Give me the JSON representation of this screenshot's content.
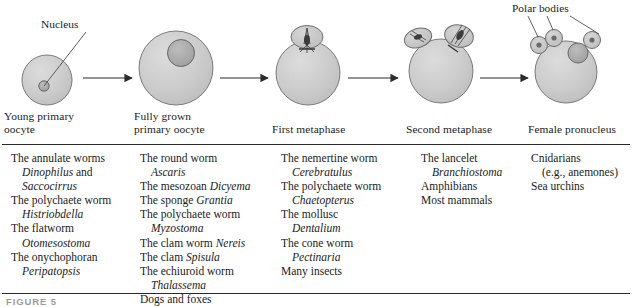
{
  "figure": {
    "caption_partial": "FIGURE 5"
  },
  "colors": {
    "cell_fill": "#c9c9c9",
    "cell_stroke": "#6e6e6e",
    "nucleus_fill": "#a8a8a8",
    "nucleus_stroke": "#5a5a5a",
    "spindle": "#4a4a4a",
    "rule": "#2b2b2b",
    "text": "#1b1b1b"
  },
  "callouts": [
    {
      "id": "nucleus",
      "label": "Nucleus"
    },
    {
      "id": "polar-bodies",
      "label": "Polar bodies"
    }
  ],
  "stages": [
    {
      "id": "young-primary-oocyte",
      "label": "Young primary\noocyte"
    },
    {
      "id": "fully-grown-primary-oocyte",
      "label": "Fully grown\nprimary oocyte"
    },
    {
      "id": "first-metaphase",
      "label": "First metaphase"
    },
    {
      "id": "second-metaphase",
      "label": "Second metaphase"
    },
    {
      "id": "female-pronucleus",
      "label": "Female pronucleus"
    }
  ],
  "arrows": [
    {
      "id": "arrow-1"
    },
    {
      "id": "arrow-2"
    },
    {
      "id": "arrow-3"
    },
    {
      "id": "arrow-4"
    }
  ],
  "species_columns": [
    {
      "id": "column-young-primary-oocyte",
      "lines": [
        {
          "text": "The annulate worms",
          "indent": false,
          "italic": false
        },
        {
          "text": "Dinophilus and",
          "indent": true,
          "italic": "partial",
          "italic_text": "Dinophilus",
          "rest": " and"
        },
        {
          "text": "Saccocirrus",
          "indent": true,
          "italic": true
        },
        {
          "text": "The polychaete worm",
          "indent": false,
          "italic": false
        },
        {
          "text": "Histriobdella",
          "indent": true,
          "italic": true
        },
        {
          "text": "The flatworm",
          "indent": false,
          "italic": false
        },
        {
          "text": "Otomesostoma",
          "indent": true,
          "italic": true
        },
        {
          "text": "The onychophoran",
          "indent": false,
          "italic": false
        },
        {
          "text": "Peripatopsis",
          "indent": true,
          "italic": true
        }
      ]
    },
    {
      "id": "column-fully-grown-primary-oocyte",
      "lines": [
        {
          "text": "The round worm",
          "indent": false,
          "italic": false
        },
        {
          "text": "Ascaris",
          "indent": true,
          "italic": true
        },
        {
          "text": "The mesozoan Dicyema",
          "indent": false,
          "italic": "partial",
          "plain_text": "The mesozoan ",
          "italic_text": "Dicyema"
        },
        {
          "text": "The sponge Grantia",
          "indent": false,
          "italic": "partial",
          "plain_text": "The sponge ",
          "italic_text": "Grantia"
        },
        {
          "text": "The polychaete worm",
          "indent": false,
          "italic": false
        },
        {
          "text": "Myzostoma",
          "indent": true,
          "italic": true
        },
        {
          "text": "The clam worm Nereis",
          "indent": false,
          "italic": "partial",
          "plain_text": "The clam worm ",
          "italic_text": "Nereis"
        },
        {
          "text": "The clam Spisula",
          "indent": false,
          "italic": "partial",
          "plain_text": "The clam ",
          "italic_text": "Spisula"
        },
        {
          "text": "The echiuroid worm",
          "indent": false,
          "italic": false
        },
        {
          "text": "Thalassema",
          "indent": true,
          "italic": true
        },
        {
          "text": "Dogs and foxes",
          "indent": false,
          "italic": false
        }
      ]
    },
    {
      "id": "column-first-metaphase",
      "lines": [
        {
          "text": "The nemertine worm",
          "indent": false,
          "italic": false
        },
        {
          "text": "Cerebratulus",
          "indent": true,
          "italic": true
        },
        {
          "text": "The polychaete worm",
          "indent": false,
          "italic": false
        },
        {
          "text": "Chaetopterus",
          "indent": true,
          "italic": true
        },
        {
          "text": "The mollusc",
          "indent": false,
          "italic": false
        },
        {
          "text": "Dentalium",
          "indent": true,
          "italic": true
        },
        {
          "text": "The cone worm",
          "indent": false,
          "italic": false
        },
        {
          "text": "Pectinaria",
          "indent": true,
          "italic": true
        },
        {
          "text": "Many insects",
          "indent": false,
          "italic": false
        }
      ]
    },
    {
      "id": "column-second-metaphase",
      "lines": [
        {
          "text": "The lancelet",
          "indent": false,
          "italic": false
        },
        {
          "text": "Branchiostoma",
          "indent": true,
          "italic": true
        },
        {
          "text": "Amphibians",
          "indent": false,
          "italic": false
        },
        {
          "text": "Most mammals",
          "indent": false,
          "italic": false
        }
      ]
    },
    {
      "id": "column-female-pronucleus",
      "lines": [
        {
          "text": "Cnidarians",
          "indent": false,
          "italic": false
        },
        {
          "text": "(e.g., anemones)",
          "indent": true,
          "italic": false
        },
        {
          "text": "Sea urchins",
          "indent": false,
          "italic": false
        }
      ]
    }
  ]
}
